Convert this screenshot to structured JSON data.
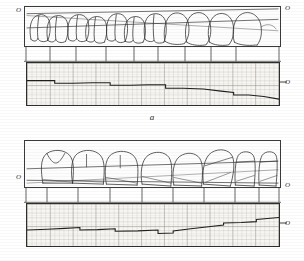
{
  "figure": {
    "type": "technical-illustration",
    "panels": [
      {
        "id": "a",
        "caption": "a",
        "tooth_diagram": {
          "name": "tooth-row-profile-a",
          "axis_label_left": "O",
          "axis_label_right": "O",
          "tooth_count": 11
        },
        "divider_strip": {
          "name": "tooth-divider-strip-a",
          "tick_count": 9
        },
        "graph": {
          "name": "occlusal-curve-graph-a",
          "axis_label_right": "O",
          "grid": "millimetre"
        }
      },
      {
        "id": "b",
        "caption": "b",
        "tooth_diagram": {
          "name": "tooth-row-profile-b",
          "axis_label_left": "O",
          "axis_label_right": "O",
          "tooth_count": 9
        },
        "divider_strip": {
          "name": "tooth-divider-strip-b",
          "tick_count": 9
        },
        "graph": {
          "name": "occlusal-curve-graph-b",
          "axis_label_right": "O",
          "grid": "millimetre"
        }
      }
    ]
  },
  "chart_data": [
    {
      "id": "graph-a",
      "type": "line",
      "title": "",
      "xlabel": "",
      "ylabel": "",
      "xlim": [
        0,
        100
      ],
      "ylim": [
        0,
        100
      ],
      "grid": true,
      "legend": false,
      "annotations": [
        "O"
      ],
      "series": [
        {
          "name": "occlusal-profile-a",
          "x": [
            0,
            6,
            11,
            11,
            18,
            26,
            33,
            33,
            41,
            48,
            55,
            55,
            62,
            70,
            77,
            82,
            82,
            88,
            94,
            100
          ],
          "y": [
            58,
            58,
            58,
            52,
            52,
            53,
            53,
            47,
            47,
            48,
            48,
            40,
            40,
            38,
            33,
            30,
            24,
            24,
            20,
            14
          ]
        }
      ]
    },
    {
      "id": "graph-b",
      "type": "line",
      "title": "",
      "xlabel": "",
      "ylabel": "",
      "xlim": [
        0,
        100
      ],
      "ylim": [
        0,
        100
      ],
      "grid": true,
      "legend": false,
      "annotations": [
        "O"
      ],
      "series": [
        {
          "name": "occlusal-profile-b",
          "x": [
            0,
            8,
            15,
            21,
            21,
            28,
            35,
            35,
            44,
            52,
            52,
            58,
            58,
            65,
            72,
            78,
            78,
            85,
            91,
            91,
            100
          ],
          "y": [
            38,
            40,
            42,
            44,
            38,
            39,
            41,
            35,
            36,
            38,
            30,
            31,
            36,
            41,
            46,
            50,
            55,
            56,
            58,
            63,
            68
          ]
        }
      ]
    }
  ],
  "colors": {
    "ink": "#2b2b2b",
    "outline": "#3a3a3a",
    "grid_minor": "#b8b4ac",
    "grid_major": "#8c887f",
    "paper": "#f7f6f3",
    "background": "#ffffff"
  }
}
